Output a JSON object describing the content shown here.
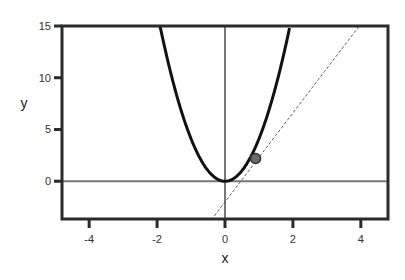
{
  "chart_data": {
    "type": "line",
    "title": "",
    "xlabel": "x",
    "ylabel": "y",
    "xlim": [
      -4.8,
      4.8
    ],
    "ylim": [
      -3.65,
      15
    ],
    "x_ticks": [
      -4,
      -2,
      0,
      2,
      4
    ],
    "x_tick_labels": [
      "-4",
      "-2",
      "0",
      "2",
      "4"
    ],
    "y_ticks": [
      0,
      5,
      10,
      15
    ],
    "y_tick_labels": [
      "0",
      "5",
      "10",
      "15"
    ],
    "grid": false,
    "legend": null,
    "reference_lines": [
      {
        "orientation": "horizontal",
        "value": 0,
        "color": "#777777"
      },
      {
        "orientation": "vertical",
        "value": 0,
        "color": "#777777"
      }
    ],
    "series": [
      {
        "name": "parabola",
        "style": "solid",
        "color": "#111111",
        "equation": "y = 4.1 x^2",
        "coef": 4.1,
        "x_range": [
          -1.92,
          1.9
        ]
      },
      {
        "name": "tangent line",
        "style": "dashed",
        "color": "#555555",
        "equation": "y = 4.3 x - 2.0",
        "slope": 4.3,
        "intercept": -2.0,
        "x_range": [
          -0.4,
          3.95
        ]
      }
    ],
    "points": [
      {
        "name": "tangent point",
        "x": 0.9,
        "y": 2.2,
        "color": "#6b6b6b"
      }
    ]
  }
}
